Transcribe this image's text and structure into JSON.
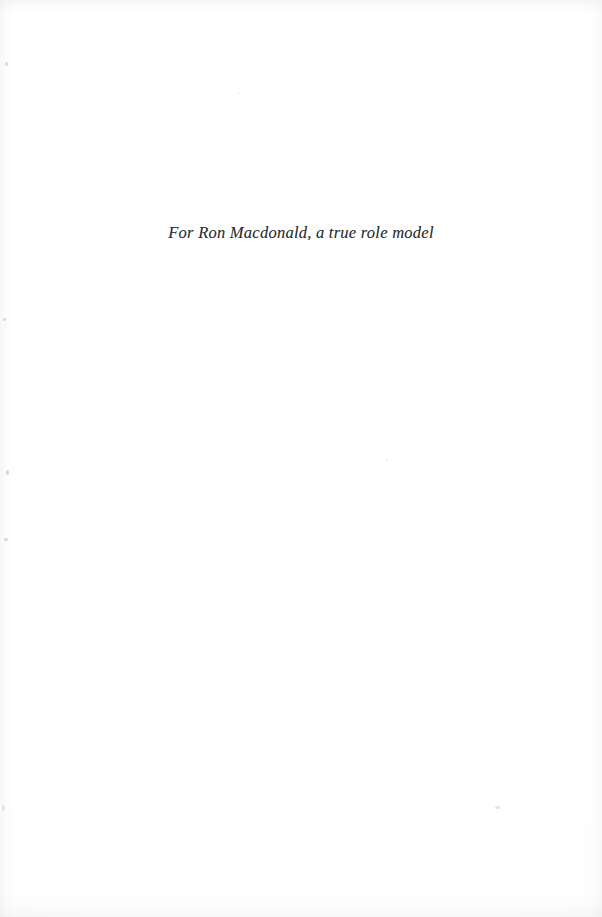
{
  "page": {
    "kind": "book-dedication-page",
    "width": 602,
    "height": 917,
    "background_color": "#ffffff",
    "text_color": "#2b2b2d"
  },
  "dedication": {
    "line": "For Ron Macdonald, a true role model"
  },
  "artifacts": {
    "edge_shade_color": "#96969c",
    "speck_color": "#82828a"
  }
}
